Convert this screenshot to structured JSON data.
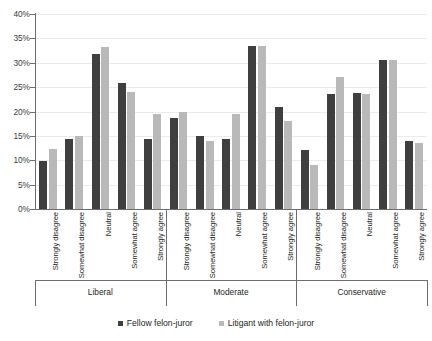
{
  "chart_data": {
    "type": "bar",
    "title": "",
    "subtitle": "",
    "xlabel": "",
    "ylabel": "",
    "ylim": [
      0,
      40
    ],
    "ytick_labels": [
      "0%",
      "5%",
      "10%",
      "15%",
      "20%",
      "25%",
      "30%",
      "35%",
      "40%"
    ],
    "ytick_values": [
      0,
      5,
      10,
      15,
      20,
      25,
      30,
      35,
      40
    ],
    "grid": true,
    "legend_position": "bottom-center",
    "categories": [
      "Strongly disagree",
      "Somewhat disagree",
      "Neutral",
      "Somewhat agree",
      "Strongly agree"
    ],
    "groups": [
      {
        "name": "Liberal",
        "series": [
          {
            "name": "Fellow felon-juror",
            "values": [
              9.8,
              14.3,
              31.8,
              25.9,
              14.3
            ]
          },
          {
            "name": "Litigant with felon-juror",
            "values": [
              12.3,
              15.0,
              33.3,
              24.0,
              19.4
            ]
          }
        ]
      },
      {
        "name": "Moderate",
        "series": [
          {
            "name": "Fellow felon-juror",
            "values": [
              18.6,
              15.0,
              14.3,
              33.5,
              21.0
            ]
          },
          {
            "name": "Litigant with felon-juror",
            "values": [
              19.9,
              13.9,
              19.4,
              33.5,
              18.1
            ]
          }
        ]
      },
      {
        "name": "Conservative",
        "series": [
          {
            "name": "Fellow felon-juror",
            "values": [
              12.2,
              23.6,
              23.8,
              30.5,
              13.9
            ]
          },
          {
            "name": "Litigant with felon-juror",
            "values": [
              9.0,
              27.0,
              23.5,
              30.6,
              13.6
            ]
          }
        ]
      }
    ],
    "series_order": [
      "Fellow felon-juror",
      "Litigant with felon-juror"
    ],
    "colors": {
      "Fellow felon-juror": "#3f3f3f",
      "Litigant with felon-juror": "#b9b9b9",
      "axis": "#6d6d6d",
      "grid": "#eceaea",
      "text": "#231f20",
      "background": "#ffffff"
    }
  },
  "legend": {
    "items": [
      {
        "label": "Fellow felon-juror",
        "color": "#3f3f3f"
      },
      {
        "label": "Litigant with felon-juror",
        "color": "#b9b9b9"
      }
    ]
  }
}
